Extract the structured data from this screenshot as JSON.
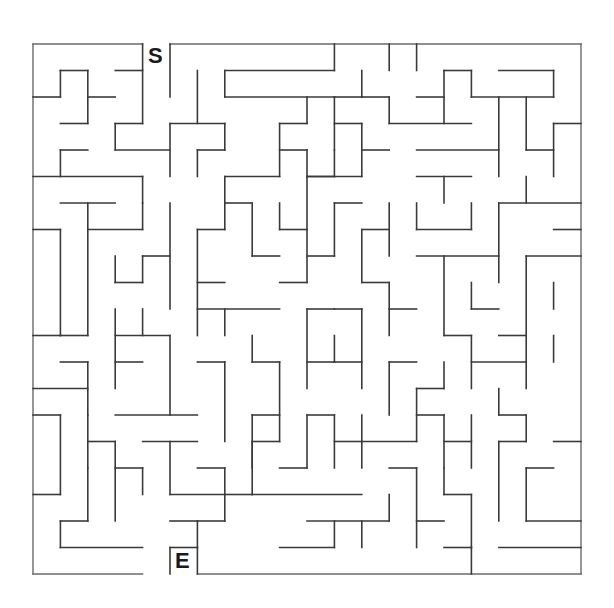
{
  "puzzle": {
    "type": "maze",
    "grid": {
      "cols": 20,
      "rows": 20,
      "origin_x": 33,
      "origin_y": 44,
      "cell_w": 27.4,
      "cell_h": 26.5
    },
    "start": {
      "label": "S",
      "col": 4
    },
    "end": {
      "label": "E",
      "col": 5
    },
    "colors": {
      "wall": "#3a3a3a",
      "background": "#ffffff",
      "label": "#1a1a1a"
    },
    "walls": [
      [
        0,
        0,
        4,
        0
      ],
      [
        5,
        0,
        20,
        0
      ],
      [
        0,
        0,
        0,
        20
      ],
      [
        20,
        0,
        20,
        20
      ],
      [
        0,
        20,
        4,
        20
      ],
      [
        6,
        20,
        20,
        20
      ],
      [
        4,
        0,
        4,
        3
      ],
      [
        1,
        1,
        2,
        1
      ],
      [
        3,
        1,
        4,
        1
      ],
      [
        1,
        1,
        1,
        2
      ],
      [
        2,
        1,
        2,
        3
      ],
      [
        0,
        2,
        1,
        2
      ],
      [
        2,
        2,
        3,
        2
      ],
      [
        1,
        3,
        2,
        3
      ],
      [
        3,
        3,
        4,
        3
      ],
      [
        3,
        3,
        3,
        4
      ],
      [
        3,
        4,
        5,
        4
      ],
      [
        5,
        0,
        5,
        2
      ],
      [
        5,
        3,
        5,
        5
      ],
      [
        6,
        1,
        6,
        3
      ],
      [
        5,
        3,
        7,
        3
      ],
      [
        7,
        3,
        7,
        4
      ],
      [
        6,
        4,
        7,
        4
      ],
      [
        6,
        4,
        6,
        5
      ],
      [
        7,
        1,
        11,
        1
      ],
      [
        7,
        1,
        7,
        2
      ],
      [
        7,
        2,
        11,
        2
      ],
      [
        11,
        0,
        11,
        1
      ],
      [
        10,
        2,
        10,
        3
      ],
      [
        9,
        3,
        10,
        3
      ],
      [
        9,
        3,
        9,
        5
      ],
      [
        9,
        4,
        10,
        4
      ],
      [
        10,
        4,
        10,
        5
      ],
      [
        10,
        5,
        11,
        5
      ],
      [
        0,
        5,
        4,
        5
      ],
      [
        1,
        4,
        1,
        5
      ],
      [
        1,
        4,
        2,
        4
      ],
      [
        4,
        5,
        4,
        6
      ],
      [
        7,
        5,
        9,
        5
      ],
      [
        7,
        5,
        7,
        7
      ],
      [
        11,
        4,
        11,
        5
      ],
      [
        13,
        0,
        13,
        1
      ],
      [
        14,
        0,
        14,
        1
      ],
      [
        12,
        1,
        12,
        2
      ],
      [
        12,
        2,
        13,
        2
      ],
      [
        13,
        2,
        13,
        3
      ],
      [
        13,
        3,
        16,
        3
      ],
      [
        14,
        2,
        15,
        2
      ],
      [
        15,
        1,
        15,
        3
      ],
      [
        15,
        1,
        16,
        1
      ],
      [
        16,
        1,
        16,
        2
      ],
      [
        16,
        2,
        19,
        2
      ],
      [
        17,
        1,
        19,
        1
      ],
      [
        19,
        1,
        19,
        2
      ],
      [
        11,
        2,
        12,
        2
      ],
      [
        11,
        2,
        11,
        4
      ],
      [
        11,
        3,
        12,
        3
      ],
      [
        12,
        3,
        12,
        5
      ],
      [
        12,
        4,
        13,
        4
      ],
      [
        14,
        4,
        17,
        4
      ],
      [
        17,
        2,
        17,
        5
      ],
      [
        18,
        2,
        18,
        4
      ],
      [
        18,
        4,
        19,
        4
      ],
      [
        19,
        3,
        20,
        3
      ],
      [
        19,
        3,
        19,
        5
      ],
      [
        10,
        5,
        12,
        5
      ],
      [
        14,
        5,
        16,
        5
      ],
      [
        15,
        5,
        15,
        6
      ],
      [
        18,
        5,
        18,
        6
      ],
      [
        1,
        6,
        3,
        6
      ],
      [
        0,
        7,
        1,
        7
      ],
      [
        1,
        7,
        1,
        11
      ],
      [
        2,
        6,
        2,
        11
      ],
      [
        1,
        11,
        2,
        11
      ],
      [
        2,
        7,
        4,
        7
      ],
      [
        4,
        6,
        4,
        7
      ],
      [
        3,
        8,
        3,
        9
      ],
      [
        3,
        9,
        4,
        9
      ],
      [
        4,
        8,
        4,
        9
      ],
      [
        4,
        8,
        5,
        8
      ],
      [
        5,
        6,
        5,
        10
      ],
      [
        6,
        7,
        6,
        11
      ],
      [
        6,
        7,
        7,
        7
      ],
      [
        6,
        9,
        7,
        9
      ],
      [
        6,
        10,
        9,
        10
      ],
      [
        7,
        6,
        8,
        6
      ],
      [
        8,
        6,
        8,
        8
      ],
      [
        8,
        8,
        9,
        8
      ],
      [
        9,
        6,
        9,
        7
      ],
      [
        9,
        7,
        10,
        7
      ],
      [
        10,
        5,
        10,
        9
      ],
      [
        9,
        9,
        10,
        9
      ],
      [
        11,
        6,
        12,
        6
      ],
      [
        11,
        6,
        11,
        8
      ],
      [
        10,
        8,
        11,
        8
      ],
      [
        12,
        7,
        13,
        7
      ],
      [
        12,
        7,
        12,
        9
      ],
      [
        13,
        6,
        13,
        8
      ],
      [
        14,
        6,
        14,
        7
      ],
      [
        14,
        7,
        16,
        7
      ],
      [
        16,
        6,
        16,
        7
      ],
      [
        17,
        6,
        17,
        9
      ],
      [
        17,
        6,
        20,
        6
      ],
      [
        19,
        7,
        20,
        7
      ],
      [
        12,
        9,
        13,
        9
      ],
      [
        13,
        9,
        13,
        11
      ],
      [
        13,
        10,
        14,
        10
      ],
      [
        14,
        8,
        17,
        8
      ],
      [
        15,
        8,
        15,
        11
      ],
      [
        16,
        9,
        16,
        10
      ],
      [
        16,
        10,
        17,
        10
      ],
      [
        18,
        8,
        18,
        12
      ],
      [
        18,
        8,
        20,
        8
      ],
      [
        19,
        9,
        19,
        10
      ],
      [
        17,
        11,
        18,
        11
      ],
      [
        0,
        11,
        1,
        11
      ],
      [
        1,
        12,
        2,
        12
      ],
      [
        2,
        12,
        2,
        14
      ],
      [
        0,
        13,
        2,
        13
      ],
      [
        3,
        10,
        3,
        13
      ],
      [
        3,
        11,
        5,
        11
      ],
      [
        4,
        10,
        4,
        11
      ],
      [
        3,
        12,
        4,
        12
      ],
      [
        5,
        11,
        5,
        14
      ],
      [
        3,
        14,
        6,
        14
      ],
      [
        6,
        12,
        7,
        12
      ],
      [
        7,
        10,
        7,
        11
      ],
      [
        7,
        12,
        7,
        15
      ],
      [
        8,
        11,
        8,
        12
      ],
      [
        8,
        12,
        9,
        12
      ],
      [
        9,
        12,
        9,
        15
      ],
      [
        8,
        14,
        9,
        14
      ],
      [
        8,
        15,
        9,
        15
      ],
      [
        10,
        10,
        11,
        10
      ],
      [
        10,
        10,
        10,
        13
      ],
      [
        10,
        12,
        11,
        12
      ],
      [
        11,
        10,
        12,
        10
      ],
      [
        11,
        11,
        11,
        12
      ],
      [
        11,
        12,
        12,
        12
      ],
      [
        12,
        10,
        12,
        13
      ],
      [
        13,
        12,
        14,
        12
      ],
      [
        13,
        12,
        13,
        14
      ],
      [
        14,
        13,
        15,
        13
      ],
      [
        14,
        13,
        14,
        15
      ],
      [
        15,
        12,
        15,
        13
      ],
      [
        15,
        11,
        16,
        11
      ],
      [
        16,
        12,
        18,
        12
      ],
      [
        16,
        11,
        16,
        13
      ],
      [
        17,
        13,
        17,
        14
      ],
      [
        17,
        14,
        18,
        14
      ],
      [
        18,
        12,
        18,
        13
      ],
      [
        19,
        11,
        19,
        12
      ],
      [
        0,
        14,
        1,
        14
      ],
      [
        1,
        14,
        1,
        17
      ],
      [
        0,
        17,
        1,
        17
      ],
      [
        2,
        14,
        2,
        16
      ],
      [
        2,
        15,
        3,
        15
      ],
      [
        3,
        15,
        3,
        18
      ],
      [
        3,
        16,
        4,
        16
      ],
      [
        4,
        16,
        4,
        17
      ],
      [
        2,
        16,
        2,
        18
      ],
      [
        1,
        18,
        2,
        18
      ],
      [
        1,
        18,
        1,
        19
      ],
      [
        1,
        19,
        4,
        19
      ],
      [
        5,
        15,
        5,
        17
      ],
      [
        4,
        15,
        6,
        15
      ],
      [
        5,
        17,
        7,
        17
      ],
      [
        7,
        16,
        7,
        18
      ],
      [
        6,
        18,
        7,
        18
      ],
      [
        6,
        16,
        7,
        16
      ],
      [
        8,
        14,
        8,
        16
      ],
      [
        8,
        15,
        8,
        17
      ],
      [
        9,
        16,
        10,
        16
      ],
      [
        7,
        17,
        8,
        17
      ],
      [
        10,
        14,
        11,
        14
      ],
      [
        10,
        14,
        10,
        16
      ],
      [
        11,
        14,
        11,
        16
      ],
      [
        11,
        15,
        12,
        15
      ],
      [
        12,
        14,
        12,
        16
      ],
      [
        12,
        15,
        14,
        15
      ],
      [
        13,
        16,
        14,
        16
      ],
      [
        14,
        14,
        15,
        14
      ],
      [
        15,
        14,
        15,
        16
      ],
      [
        15,
        15,
        16,
        15
      ],
      [
        16,
        14,
        16,
        16
      ],
      [
        17,
        15,
        17,
        18
      ],
      [
        17,
        15,
        18,
        15
      ],
      [
        18,
        14,
        18,
        15
      ],
      [
        18,
        16,
        18,
        18
      ],
      [
        18,
        18,
        20,
        18
      ],
      [
        17,
        19,
        20,
        19
      ],
      [
        19,
        15,
        20,
        15
      ],
      [
        5,
        18,
        6,
        18
      ],
      [
        6,
        18,
        6,
        19
      ],
      [
        5,
        19,
        6,
        19
      ],
      [
        5,
        19,
        5,
        20
      ],
      [
        6,
        19,
        6,
        20
      ],
      [
        8,
        17,
        12,
        17
      ],
      [
        10,
        18,
        13,
        18
      ],
      [
        11,
        18,
        11,
        19
      ],
      [
        12,
        18,
        12,
        19
      ],
      [
        9,
        19,
        11,
        19
      ],
      [
        13,
        17,
        13,
        18
      ],
      [
        14,
        16,
        14,
        19
      ],
      [
        15,
        16,
        15,
        17
      ],
      [
        15,
        17,
        16,
        17
      ],
      [
        16,
        17,
        16,
        19
      ],
      [
        16,
        19,
        16,
        20
      ],
      [
        14,
        18,
        15,
        18
      ],
      [
        15,
        19,
        16,
        19
      ],
      [
        18,
        16,
        19,
        16
      ]
    ]
  }
}
